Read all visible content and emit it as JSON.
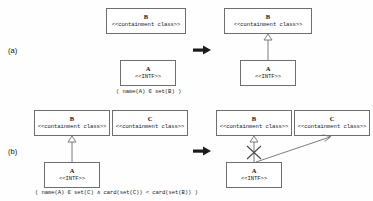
{
  "figure": {
    "background_color": "#fefefe",
    "line_color": "#6e6e6e",
    "text_color": "#1a1a1a"
  },
  "rows": [
    {
      "id": "a",
      "label": "(a)",
      "caption": "( name(A) ∈ set(B) )",
      "transform_arrow": "→",
      "before": {
        "boxes": [
          {
            "key": "B",
            "name": "B",
            "stereotype": "<<containment class>>"
          },
          {
            "key": "A",
            "name": "A",
            "stereotype": "<<INTF>>"
          }
        ],
        "links": []
      },
      "after": {
        "boxes": [
          {
            "key": "B",
            "name": "B",
            "stereotype": "<<containment class>>"
          },
          {
            "key": "A",
            "name": "A",
            "stereotype": "<<INTF>>"
          }
        ],
        "links": [
          {
            "kind": "generalization",
            "from": "A",
            "to": "B",
            "crossed_out": false
          }
        ]
      }
    },
    {
      "id": "b",
      "label": "(b)",
      "caption": "( name(A) ∈ set(C) ∧ card(set(C)) < card(set(B)) )",
      "transform_arrow": "→",
      "before": {
        "boxes": [
          {
            "key": "B",
            "name": "B",
            "stereotype": "<<containment class>>"
          },
          {
            "key": "C",
            "name": "C",
            "stereotype": "<<containment class>>"
          },
          {
            "key": "A",
            "name": "A",
            "stereotype": "<<INTF>>"
          }
        ],
        "links": [
          {
            "kind": "generalization",
            "from": "A",
            "to": "B",
            "crossed_out": false
          }
        ]
      },
      "after": {
        "boxes": [
          {
            "key": "B",
            "name": "B",
            "stereotype": "<<containment class>>"
          },
          {
            "key": "C",
            "name": "C",
            "stereotype": "<<containment class>>"
          },
          {
            "key": "A",
            "name": "A",
            "stereotype": "<<INTF>>"
          }
        ],
        "links": [
          {
            "kind": "generalization",
            "from": "A",
            "to": "B",
            "crossed_out": true
          },
          {
            "kind": "association",
            "from": "A",
            "to": "C",
            "crossed_out": false
          }
        ]
      }
    }
  ]
}
